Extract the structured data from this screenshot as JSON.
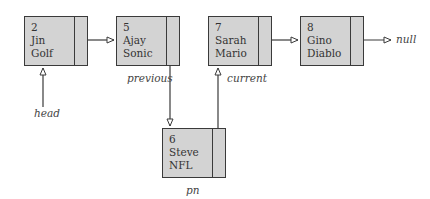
{
  "diagram": {
    "type": "linked-list-insertion",
    "colors": {
      "node_fill": "#d3d3d3",
      "border": "#3a3a3a",
      "text": "#333333"
    },
    "nodes": [
      {
        "id": "n2",
        "number": "2",
        "name": "Jin",
        "game": "Golf"
      },
      {
        "id": "n5",
        "number": "5",
        "name": "Ajay",
        "game": "Sonic"
      },
      {
        "id": "n7",
        "number": "7",
        "name": "Sarah",
        "game": "Mario"
      },
      {
        "id": "n8",
        "number": "8",
        "name": "Gino",
        "game": "Diablo"
      },
      {
        "id": "n6",
        "number": "6",
        "name": "Steve",
        "game": "NFL"
      }
    ],
    "labels": {
      "head": "head",
      "previous": "previous",
      "current": "current",
      "pn": "pn",
      "null": "null"
    },
    "edges": [
      {
        "from": "n2",
        "to": "n5"
      },
      {
        "from": "n5",
        "to": "n6"
      },
      {
        "from": "n6",
        "to": "n7"
      },
      {
        "from": "n7",
        "to": "n8"
      },
      {
        "from": "n8",
        "to": "null"
      },
      {
        "from": "head",
        "to": "n2"
      }
    ]
  }
}
